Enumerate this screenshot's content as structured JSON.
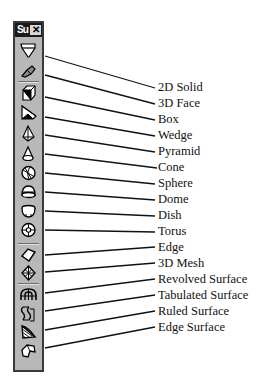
{
  "toolbar": {
    "title": "Su",
    "close_label": "✕",
    "colors": {
      "background": "#b8b8b8",
      "titlebar": "#1a1a1a",
      "border": "#3a3a3a"
    },
    "buttons": [
      {
        "name": "2d-solid",
        "icon": "2d-solid-icon",
        "label": "2D Solid"
      },
      {
        "name": "3d-face",
        "icon": "3d-face-icon",
        "label": "3D Face"
      },
      {
        "name": "box",
        "icon": "box-icon",
        "label": "Box"
      },
      {
        "name": "wedge",
        "icon": "wedge-icon",
        "label": "Wedge"
      },
      {
        "name": "pyramid",
        "icon": "pyramid-icon",
        "label": "Pyramid"
      },
      {
        "name": "cone",
        "icon": "cone-icon",
        "label": "Cone"
      },
      {
        "name": "sphere",
        "icon": "sphere-icon",
        "label": "Sphere"
      },
      {
        "name": "dome",
        "icon": "dome-icon",
        "label": "Dome"
      },
      {
        "name": "dish",
        "icon": "dish-icon",
        "label": "Dish"
      },
      {
        "name": "torus",
        "icon": "torus-icon",
        "label": "Torus"
      },
      {
        "name": "edge",
        "icon": "edge-icon",
        "label": "Edge"
      },
      {
        "name": "3d-mesh",
        "icon": "3d-mesh-icon",
        "label": "3D Mesh"
      },
      {
        "name": "revolved-surface",
        "icon": "revolved-surface-icon",
        "label": "Revolved Surface"
      },
      {
        "name": "tabulated-surface",
        "icon": "tabulated-surface-icon",
        "label": "Tabulated Surface"
      },
      {
        "name": "ruled-surface",
        "icon": "ruled-surface-icon",
        "label": "Ruled Surface"
      },
      {
        "name": "edge-surface",
        "icon": "edge-surface-icon",
        "label": "Edge Surface"
      }
    ]
  }
}
